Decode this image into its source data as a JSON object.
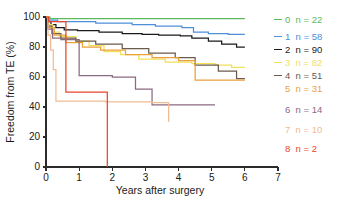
{
  "chart_data": {
    "type": "line",
    "title": "",
    "xlabel": "Years after surgery",
    "ylabel": "Freedom from TE (%)",
    "xlim": [
      0,
      7
    ],
    "ylim": [
      0,
      100
    ],
    "xticks": [
      0,
      1,
      2,
      3,
      4,
      5,
      6,
      7
    ],
    "xtick_labels": [
      "0",
      "1",
      "2",
      "3",
      "4",
      "5",
      "6",
      "7"
    ],
    "yticks": [
      0,
      20,
      40,
      60,
      80,
      100
    ],
    "ytick_labels": [
      "0",
      "20",
      "40",
      "60",
      "80",
      "100"
    ],
    "grid": false,
    "legend_position": "right",
    "step_style": "post",
    "series": [
      {
        "name": "0",
        "label": "0  n = 22",
        "n": 22,
        "color": "#5cb85c",
        "legend_stub": true,
        "x": [
          0,
          0.12,
          6.0
        ],
        "y": [
          100,
          99,
          99
        ]
      },
      {
        "name": "1",
        "label": "1  n = 58",
        "n": 58,
        "color": "#4d90d9",
        "legend_stub": true,
        "x": [
          0,
          0.08,
          0.35,
          1.5,
          2.6,
          3.3,
          4.1,
          4.45,
          4.9,
          5.5,
          6.0
        ],
        "y": [
          100,
          98,
          97,
          96,
          95,
          94,
          93,
          90,
          89,
          88.5,
          88.5
        ]
      },
      {
        "name": "2",
        "label": "2  n = 90",
        "n": 90,
        "color": "#1a1a1a",
        "legend_stub": true,
        "x": [
          0,
          0.05,
          0.15,
          0.3,
          0.55,
          0.95,
          1.6,
          2.3,
          2.9,
          3.4,
          4.05,
          4.4,
          4.9,
          5.3,
          5.75,
          6.0
        ],
        "y": [
          100,
          97,
          95,
          93,
          91.5,
          91,
          90,
          89,
          88.5,
          88,
          87.5,
          86,
          84,
          82,
          80,
          80
        ]
      },
      {
        "name": "3",
        "label": "3  n = 82",
        "n": 82,
        "color": "#f2e05a",
        "legend_stub": true,
        "x": [
          0,
          0.06,
          0.2,
          0.4,
          0.9,
          1.3,
          1.75,
          2.25,
          2.8,
          3.6,
          4.4,
          5.1,
          5.6,
          6.0
        ],
        "y": [
          100,
          95,
          90,
          87,
          84,
          81,
          77,
          75,
          72,
          70,
          69,
          68,
          66.5,
          66.5
        ]
      },
      {
        "name": "4",
        "label": "4  n = 51",
        "n": 51,
        "color": "#6b5a4e",
        "legend_stub": true,
        "x": [
          0,
          0.05,
          0.18,
          0.45,
          0.9,
          1.5,
          2.3,
          3.1,
          3.9,
          4.5,
          5.2,
          5.75,
          6.0
        ],
        "y": [
          100,
          94,
          89,
          86,
          84,
          82,
          79,
          76,
          73,
          68,
          64,
          59,
          59
        ]
      },
      {
        "name": "5",
        "label": "5  n = 31",
        "n": 31,
        "color": "#e8a13c",
        "legend_stub": false,
        "x": [
          0,
          0.07,
          0.25,
          0.6,
          1.1,
          1.65,
          2.4,
          3.2,
          4.0,
          4.5,
          5.3,
          6.0
        ],
        "y": [
          100,
          93,
          88,
          83,
          80,
          78,
          75,
          73,
          71,
          58,
          58,
          58
        ]
      },
      {
        "name": "6",
        "label": "6  n = 14",
        "n": 14,
        "color": "#8a6a82",
        "legend_stub": false,
        "x": [
          0,
          0.05,
          0.2,
          0.45,
          1.0,
          2.0,
          2.7,
          3.2,
          4.1,
          5.1
        ],
        "y": [
          100,
          92,
          86,
          85,
          61,
          60,
          52,
          41.5,
          41.5,
          41.5
        ]
      },
      {
        "name": "7",
        "label": "7  n = 10",
        "n": 10,
        "color": "#f0bb95",
        "legend_stub": false,
        "x": [
          0,
          0.06,
          0.14,
          0.22,
          0.3,
          1.8,
          3.2,
          3.7
        ],
        "y": [
          100,
          88,
          78,
          65,
          44,
          43.5,
          43,
          30
        ]
      },
      {
        "name": "8",
        "label": "8  n = 2",
        "n": 2,
        "color": "#e8472c",
        "legend_stub": false,
        "x": [
          0,
          0.08,
          0.6,
          1.85
        ],
        "y": [
          100,
          97,
          50,
          0
        ]
      }
    ]
  },
  "axes": {
    "x_title": "Years after surgery",
    "y_title": "Freedom from TE (%)"
  },
  "legend": {
    "items": [
      {
        "label": "0  n = 22",
        "color": "#5cb85c",
        "stub": true
      },
      {
        "label": "1  n = 58",
        "color": "#4d90d9",
        "stub": true
      },
      {
        "label": "2  n = 90",
        "color": "#1a1a1a",
        "stub": true
      },
      {
        "label": "3  n = 82",
        "color": "#f2e05a",
        "stub": true
      },
      {
        "label": "4  n = 51",
        "color": "#6b5a4e",
        "stub": true
      },
      {
        "label": "5  n = 31",
        "color": "#e8a13c",
        "stub": false
      },
      {
        "label": "6  n = 14",
        "color": "#8a6a82",
        "stub": false
      },
      {
        "label": "7  n = 10",
        "color": "#f0bb95",
        "stub": false
      },
      {
        "label": "8  n = 2",
        "color": "#e8472c",
        "stub": false
      }
    ]
  }
}
